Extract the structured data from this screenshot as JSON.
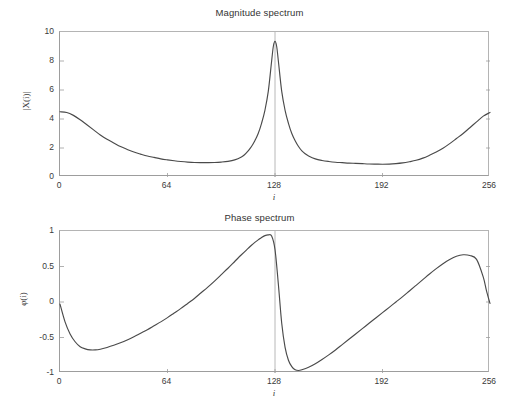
{
  "figure": {
    "background": "#ffffff",
    "line_color": "#4a4a4a",
    "axis_color": "#9d9d9d"
  },
  "charts": {
    "magnitude": {
      "title": "Magnitude spectrum",
      "xlabel": "i",
      "ylabel": "|X(i)|",
      "xticks": [
        "0",
        "64",
        "128",
        "192",
        "256"
      ],
      "yticks": [
        "10",
        "8",
        "6",
        "4",
        "2",
        "0"
      ]
    },
    "phase": {
      "title": "Phase spectrum",
      "xlabel": "i",
      "ylabel": "φ(i)",
      "xticks": [
        "0",
        "64",
        "128",
        "192",
        "256"
      ],
      "yticks": [
        "1",
        "0.5",
        "0",
        "-0.5",
        "-1"
      ]
    }
  },
  "chart_data": [
    {
      "type": "line",
      "id": "magnitude-spectrum",
      "title": "Magnitude spectrum",
      "xlabel": "i",
      "ylabel": "|X(i)|",
      "xlim": [
        0,
        256
      ],
      "ylim": [
        0,
        10
      ],
      "xticks": [
        0,
        64,
        128,
        192,
        256
      ],
      "yticks": [
        0,
        2,
        4,
        6,
        8,
        10
      ],
      "grid": false,
      "legend": null,
      "annotations": [
        "vertical reference line at i = 128"
      ],
      "series": [
        {
          "name": "|X(i)|",
          "color": "#4a4a4a",
          "x": [
            0,
            4,
            8,
            12,
            16,
            20,
            24,
            28,
            32,
            36,
            40,
            44,
            48,
            52,
            56,
            60,
            64,
            68,
            72,
            76,
            80,
            84,
            88,
            92,
            96,
            100,
            104,
            108,
            110,
            112,
            114,
            116,
            118,
            120,
            122,
            124,
            126,
            127,
            128,
            129,
            130,
            132,
            134,
            136,
            138,
            140,
            142,
            144,
            146,
            148,
            152,
            156,
            160,
            164,
            168,
            172,
            176,
            180,
            184,
            188,
            192,
            196,
            200,
            204,
            208,
            212,
            216,
            220,
            224,
            228,
            232,
            236,
            240,
            244,
            248,
            252,
            256
          ],
          "y": [
            4.5,
            4.45,
            4.25,
            3.95,
            3.6,
            3.25,
            2.9,
            2.6,
            2.35,
            2.1,
            1.9,
            1.72,
            1.58,
            1.45,
            1.35,
            1.25,
            1.18,
            1.12,
            1.07,
            1.03,
            1.0,
            0.99,
            0.99,
            1.0,
            1.03,
            1.08,
            1.18,
            1.38,
            1.55,
            1.8,
            2.1,
            2.5,
            3.0,
            3.7,
            4.6,
            5.9,
            8.0,
            9.0,
            9.35,
            9.0,
            8.0,
            5.9,
            4.6,
            3.7,
            3.0,
            2.5,
            2.1,
            1.8,
            1.6,
            1.45,
            1.25,
            1.14,
            1.07,
            1.02,
            0.99,
            0.96,
            0.94,
            0.92,
            0.9,
            0.89,
            0.88,
            0.89,
            0.92,
            0.97,
            1.05,
            1.15,
            1.3,
            1.5,
            1.72,
            1.98,
            2.3,
            2.65,
            3.0,
            3.4,
            3.8,
            4.2,
            4.45
          ]
        }
      ]
    },
    {
      "type": "line",
      "id": "phase-spectrum",
      "title": "Phase spectrum",
      "xlabel": "i",
      "ylabel": "φ(i)",
      "xlim": [
        0,
        256
      ],
      "ylim": [
        -1,
        1
      ],
      "xticks": [
        0,
        64,
        128,
        192,
        256
      ],
      "yticks": [
        -1,
        -0.5,
        0,
        0.5,
        1
      ],
      "grid": false,
      "legend": null,
      "annotations": [
        "vertical reference line at i = 128"
      ],
      "series": [
        {
          "name": "φ(i)",
          "color": "#4a4a4a",
          "x": [
            0,
            3,
            6,
            9,
            12,
            15,
            18,
            21,
            24,
            28,
            32,
            36,
            40,
            44,
            48,
            52,
            56,
            60,
            64,
            68,
            72,
            76,
            80,
            84,
            88,
            92,
            96,
            100,
            104,
            108,
            112,
            114,
            116,
            118,
            120,
            122,
            124,
            126,
            128,
            130,
            132,
            134,
            136,
            138,
            140,
            142,
            144,
            148,
            152,
            156,
            160,
            164,
            168,
            172,
            176,
            180,
            184,
            188,
            192,
            196,
            200,
            204,
            208,
            212,
            216,
            220,
            224,
            228,
            232,
            236,
            240,
            244,
            248,
            252,
            254,
            256
          ],
          "y": [
            -0.03,
            -0.28,
            -0.45,
            -0.56,
            -0.63,
            -0.66,
            -0.675,
            -0.675,
            -0.665,
            -0.64,
            -0.61,
            -0.575,
            -0.535,
            -0.49,
            -0.44,
            -0.39,
            -0.335,
            -0.28,
            -0.22,
            -0.155,
            -0.09,
            -0.02,
            0.05,
            0.13,
            0.21,
            0.295,
            0.385,
            0.475,
            0.57,
            0.665,
            0.755,
            0.8,
            0.84,
            0.875,
            0.91,
            0.935,
            0.945,
            0.93,
            0.74,
            0.25,
            -0.3,
            -0.64,
            -0.82,
            -0.91,
            -0.955,
            -0.965,
            -0.955,
            -0.92,
            -0.87,
            -0.81,
            -0.745,
            -0.675,
            -0.6,
            -0.525,
            -0.45,
            -0.375,
            -0.3,
            -0.225,
            -0.15,
            -0.075,
            0.0,
            0.075,
            0.155,
            0.235,
            0.315,
            0.395,
            0.47,
            0.54,
            0.6,
            0.645,
            0.665,
            0.655,
            0.6,
            0.35,
            0.15,
            -0.02
          ]
        }
      ]
    }
  ]
}
